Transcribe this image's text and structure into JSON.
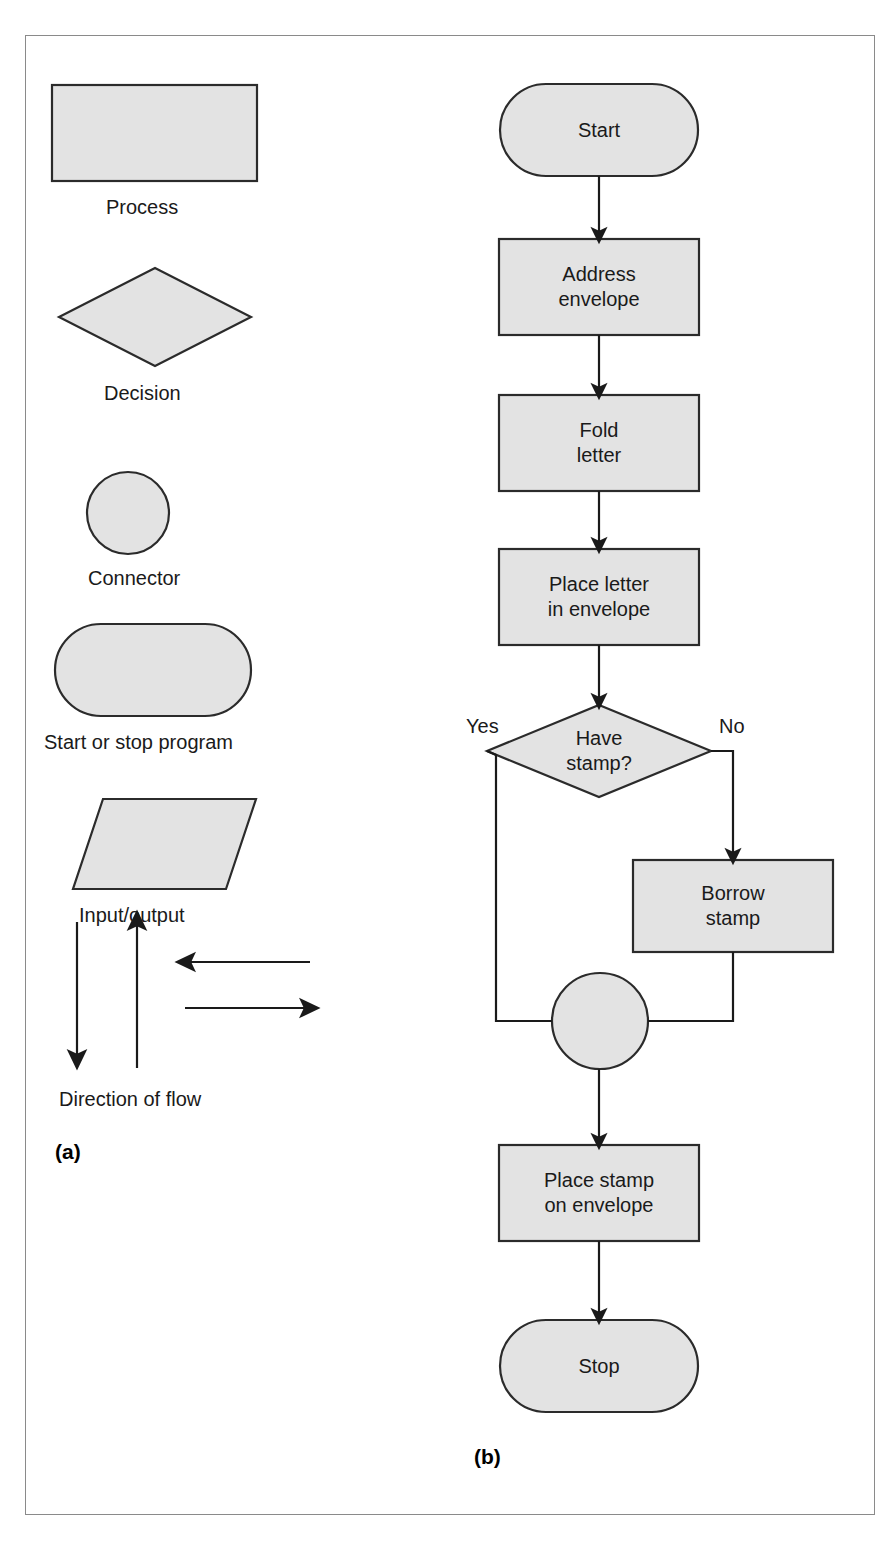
{
  "figure": {
    "panel_a_tag": "(a)",
    "panel_b_tag": "(b)"
  },
  "legend": {
    "title": "Flowchart symbols",
    "items": [
      {
        "shape": "rectangle",
        "icon": "process-symbol-icon",
        "label": "Process"
      },
      {
        "shape": "diamond",
        "icon": "decision-symbol-icon",
        "label": "Decision"
      },
      {
        "shape": "circle",
        "icon": "connector-symbol-icon",
        "label": "Connector"
      },
      {
        "shape": "stadium",
        "icon": "terminator-symbol-icon",
        "label": "Start or stop program"
      },
      {
        "shape": "parallelogram",
        "icon": "input-output-symbol-icon",
        "label": "Input/output"
      },
      {
        "shape": "arrows",
        "icon": "direction-of-flow-icon",
        "label": "Direction of flow"
      }
    ],
    "arrow_directions": [
      "down",
      "up",
      "left",
      "right"
    ]
  },
  "flowchart": {
    "title": "Mailing a letter",
    "nodes": [
      {
        "id": "start",
        "type": "terminator",
        "label": "Start"
      },
      {
        "id": "address",
        "type": "process",
        "label": "Address\nenvelope"
      },
      {
        "id": "fold",
        "type": "process",
        "label": "Fold\nletter"
      },
      {
        "id": "place_letter",
        "type": "process",
        "label": "Place letter\nin envelope"
      },
      {
        "id": "have_stamp",
        "type": "decision",
        "label": "Have\nstamp?"
      },
      {
        "id": "borrow",
        "type": "process",
        "label": "Borrow\nstamp"
      },
      {
        "id": "junction",
        "type": "connector",
        "label": ""
      },
      {
        "id": "place_stamp",
        "type": "process",
        "label": "Place stamp\non envelope"
      },
      {
        "id": "stop",
        "type": "terminator",
        "label": "Stop"
      }
    ],
    "branch_labels": {
      "yes": "Yes",
      "no": "No"
    },
    "edges": [
      {
        "from": "start",
        "to": "address",
        "label": "",
        "arrow": true
      },
      {
        "from": "address",
        "to": "fold",
        "label": "",
        "arrow": true
      },
      {
        "from": "fold",
        "to": "place_letter",
        "label": "",
        "arrow": true
      },
      {
        "from": "place_letter",
        "to": "have_stamp",
        "label": "",
        "arrow": true
      },
      {
        "from": "have_stamp",
        "to": "junction",
        "label": "Yes",
        "arrow": false
      },
      {
        "from": "have_stamp",
        "to": "borrow",
        "label": "No",
        "arrow": true
      },
      {
        "from": "borrow",
        "to": "junction",
        "label": "",
        "arrow": false
      },
      {
        "from": "junction",
        "to": "place_stamp",
        "label": "",
        "arrow": true
      },
      {
        "from": "place_stamp",
        "to": "stop",
        "label": "",
        "arrow": true
      }
    ]
  },
  "colors": {
    "shape_fill": "#e3e3e3",
    "shape_stroke": "#2b2b2b",
    "connector_line": "#1a1a1a",
    "frame_border": "#8a8a8a",
    "text": "#1a1a1a",
    "background": "#ffffff"
  }
}
